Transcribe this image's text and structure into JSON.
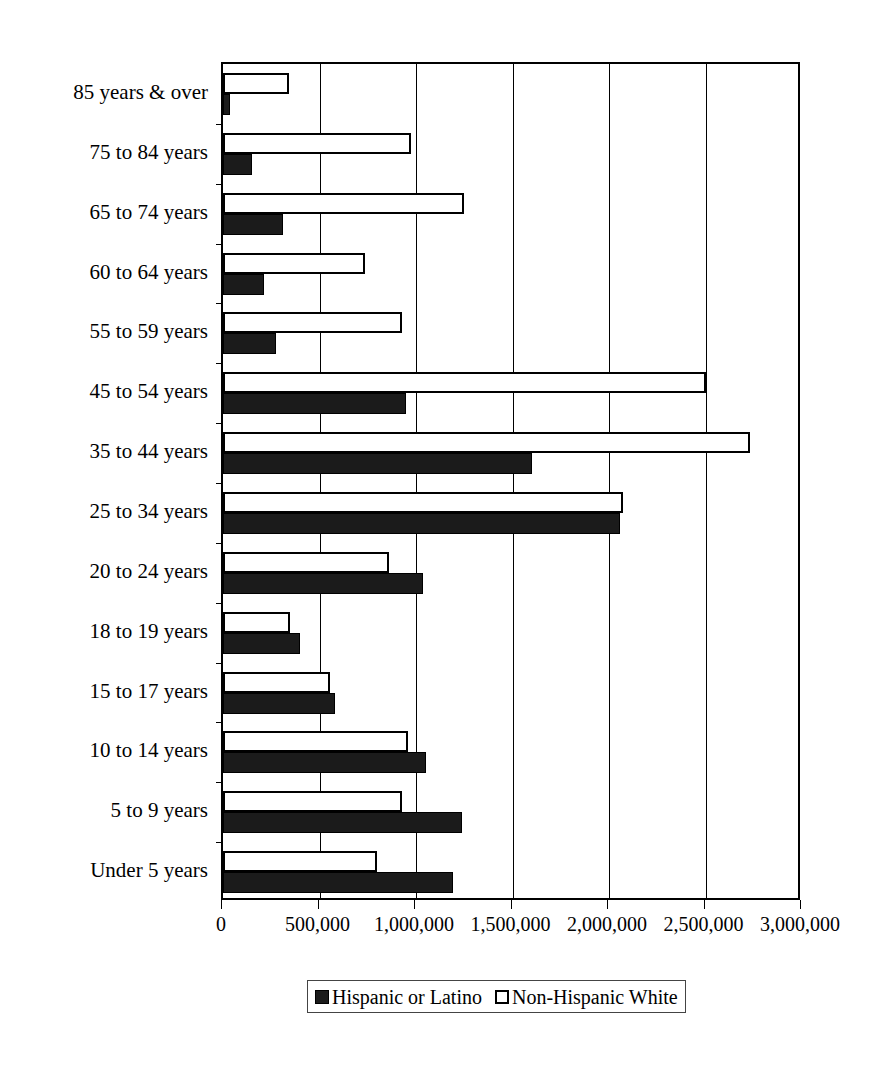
{
  "chart_data": {
    "type": "bar",
    "orientation": "horizontal",
    "title": "",
    "subtitle": "",
    "xlabel": "",
    "ylabel": "",
    "xlim": [
      0,
      3000000
    ],
    "ylim": null,
    "grid": true,
    "grid_axis": "x",
    "legend_position": "bottom-center",
    "xticks": [
      0,
      500000,
      1000000,
      1500000,
      2000000,
      2500000,
      3000000
    ],
    "xtick_labels": [
      "0",
      "500,000",
      "1,000,000",
      "1,500,000",
      "2,000,000",
      "2,500,000",
      "3,000,000"
    ],
    "categories": [
      "85 years & over",
      "75 to 84 years",
      "65 to 74 years",
      "60 to 64 years",
      "55 to 59 years",
      "45 to 54 years",
      "35 to 44 years",
      "25 to 34 years",
      "20 to 24 years",
      "18 to 19 years",
      "15 to 17 years",
      "10 to 14 years",
      "5 to 9 years",
      "Under 5 years"
    ],
    "series": [
      {
        "name": "Hispanic  or Latino",
        "color": "#1b1b1b",
        "style": "filled",
        "values": [
          36000,
          150000,
          310000,
          215000,
          275000,
          950000,
          1600000,
          2057000,
          1035000,
          400000,
          580000,
          1050000,
          1240000,
          1190000
        ]
      },
      {
        "name": "Non-Hispanic White",
        "color": "#ffffff",
        "style": "open",
        "values": [
          342000,
          975000,
          1250000,
          735000,
          930000,
          2500000,
          2732000,
          2073000,
          860000,
          345000,
          555000,
          960000,
          925000,
          800000
        ]
      }
    ]
  },
  "legend": {
    "entries": [
      {
        "label": "Hispanic  or Latino",
        "swatch": "filled-square-icon"
      },
      {
        "label": "Non-Hispanic White",
        "swatch": "open-square-icon"
      }
    ]
  }
}
